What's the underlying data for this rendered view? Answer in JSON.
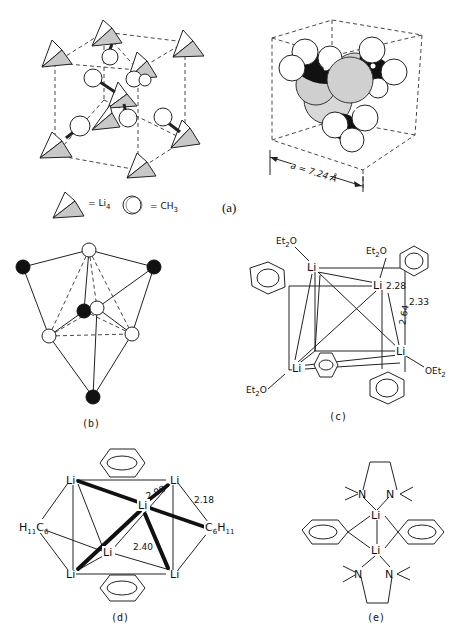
{
  "figure": {
    "panels": [
      {
        "id": "a",
        "caption": "(a)"
      },
      {
        "id": "b",
        "caption": "(b)"
      },
      {
        "id": "c",
        "caption": "(c)"
      },
      {
        "id": "d",
        "caption": "(d)"
      },
      {
        "id": "e",
        "caption": "(e)"
      }
    ]
  },
  "panel_a": {
    "caption": "(a)",
    "legend": {
      "li4_symbol": "= Li",
      "li4_sub": "4",
      "ch3_symbol": "= CH",
      "ch3_sub": "3"
    },
    "cell_label": "a = 7.24 Å"
  },
  "panel_b": {
    "caption": "(b)"
  },
  "panel_c": {
    "caption": "(c)",
    "ligands": {
      "et2o_tl": "Et",
      "et2o_tr": "Et",
      "et2o_bl": "Et",
      "oet2_br": "OEt"
    },
    "atoms": [
      "Li",
      "Li",
      "Li",
      "Li"
    ],
    "distances": [
      "2.28",
      "2.33",
      "2.64"
    ]
  },
  "panel_d": {
    "caption": "(d)",
    "atoms": [
      "Li",
      "Li",
      "Li",
      "Li",
      "Li",
      "Li"
    ],
    "left_group": "H11C6",
    "right_group": "C6H11",
    "distances": [
      "2.98",
      "2.18",
      "2.40"
    ]
  },
  "panel_e": {
    "caption": "(e)",
    "atoms": [
      "Li",
      "Li"
    ],
    "n_labels": [
      "N",
      "N",
      "N",
      "N"
    ]
  }
}
